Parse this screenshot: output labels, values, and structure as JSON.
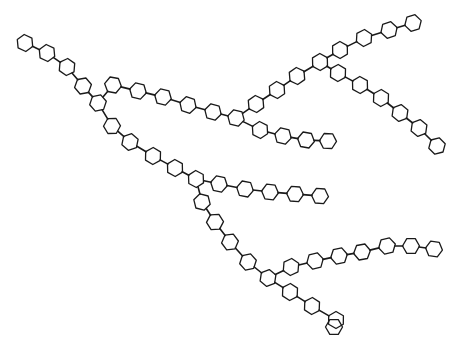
{
  "diagram": {
    "type": "branched polyphenylene chain structure",
    "ring_radius": 8.5,
    "stroke_color": "#1a1a1a",
    "background": "#ffffff",
    "rings": [
      [
        25,
        43
      ],
      [
        47,
        53
      ],
      [
        67,
        67
      ],
      [
        83,
        86
      ],
      [
        98,
        103
      ],
      [
        113,
        85
      ],
      [
        138,
        91
      ],
      [
        163,
        97
      ],
      [
        188,
        105
      ],
      [
        213,
        112
      ],
      [
        236,
        118
      ],
      [
        256,
        104
      ],
      [
        277,
        90
      ],
      [
        297,
        76
      ],
      [
        320,
        62
      ],
      [
        340,
        50
      ],
      [
        364,
        38
      ],
      [
        389,
        30
      ],
      [
        413,
        23
      ],
      [
        338,
        73
      ],
      [
        360,
        85
      ],
      [
        381,
        98
      ],
      [
        400,
        113
      ],
      [
        419,
        128
      ],
      [
        437,
        146
      ],
      [
        260,
        130
      ],
      [
        283,
        136
      ],
      [
        306,
        140
      ],
      [
        328,
        141
      ],
      [
        112,
        126
      ],
      [
        130,
        142
      ],
      [
        153,
        156
      ],
      [
        175,
        168
      ],
      [
        196,
        179
      ],
      [
        219,
        184
      ],
      [
        245,
        189
      ],
      [
        270,
        192
      ],
      [
        295,
        194
      ],
      [
        320,
        196
      ],
      [
        202,
        202
      ],
      [
        215,
        222
      ],
      [
        230,
        242
      ],
      [
        248,
        262
      ],
      [
        268,
        278
      ],
      [
        291,
        267
      ],
      [
        315,
        261
      ],
      [
        339,
        256
      ],
      [
        362,
        252
      ],
      [
        387,
        246
      ],
      [
        411,
        246
      ],
      [
        434,
        249
      ],
      [
        290,
        292
      ],
      [
        312,
        306
      ],
      [
        336,
        320
      ],
      [
        334,
        327
      ]
    ],
    "bonds": [
      [
        0,
        1
      ],
      [
        1,
        2
      ],
      [
        2,
        3
      ],
      [
        3,
        4
      ],
      [
        4,
        5
      ],
      [
        5,
        6
      ],
      [
        6,
        7
      ],
      [
        7,
        8
      ],
      [
        8,
        9
      ],
      [
        9,
        10
      ],
      [
        10,
        11
      ],
      [
        11,
        12
      ],
      [
        12,
        13
      ],
      [
        13,
        14
      ],
      [
        14,
        15
      ],
      [
        15,
        16
      ],
      [
        16,
        17
      ],
      [
        17,
        18
      ],
      [
        14,
        19
      ],
      [
        19,
        20
      ],
      [
        20,
        21
      ],
      [
        21,
        22
      ],
      [
        22,
        23
      ],
      [
        23,
        24
      ],
      [
        10,
        25
      ],
      [
        25,
        26
      ],
      [
        26,
        27
      ],
      [
        27,
        28
      ],
      [
        4,
        29
      ],
      [
        29,
        30
      ],
      [
        30,
        31
      ],
      [
        31,
        32
      ],
      [
        32,
        33
      ],
      [
        33,
        34
      ],
      [
        34,
        35
      ],
      [
        35,
        36
      ],
      [
        36,
        37
      ],
      [
        37,
        38
      ],
      [
        33,
        39
      ],
      [
        39,
        40
      ],
      [
        40,
        41
      ],
      [
        41,
        42
      ],
      [
        42,
        43
      ],
      [
        43,
        44
      ],
      [
        44,
        45
      ],
      [
        45,
        46
      ],
      [
        46,
        47
      ],
      [
        47,
        48
      ],
      [
        48,
        49
      ],
      [
        49,
        50
      ],
      [
        43,
        51
      ],
      [
        51,
        52
      ],
      [
        52,
        53
      ]
    ]
  }
}
